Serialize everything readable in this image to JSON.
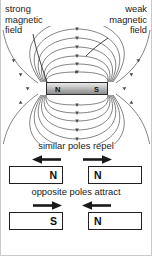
{
  "field_diagram": {
    "label_left": "strong\nmagnetic\nfield",
    "label_right": "weak\nmagnetic\nfield",
    "magnet": {
      "north_label": "N",
      "south_label": "S"
    },
    "colors": {
      "field_line": "#5a5a5a",
      "leader_line": "#2e2e2e",
      "magnet_border": "#2b2b2b",
      "text": "#1a1a1a"
    }
  },
  "interactions": [
    {
      "id": "repel",
      "caption": "similar poles repel",
      "left_magnet": {
        "pole": "N",
        "pole_side": "right"
      },
      "right_magnet": {
        "pole": "N",
        "pole_side": "left"
      },
      "left_arrow_direction": "left",
      "right_arrow_direction": "right"
    },
    {
      "id": "attract",
      "caption": "opposite poles attract",
      "left_magnet": {
        "pole": "S",
        "pole_side": "right"
      },
      "right_magnet": {
        "pole": "N",
        "pole_side": "left"
      },
      "left_arrow_direction": "right",
      "right_arrow_direction": "left"
    }
  ]
}
